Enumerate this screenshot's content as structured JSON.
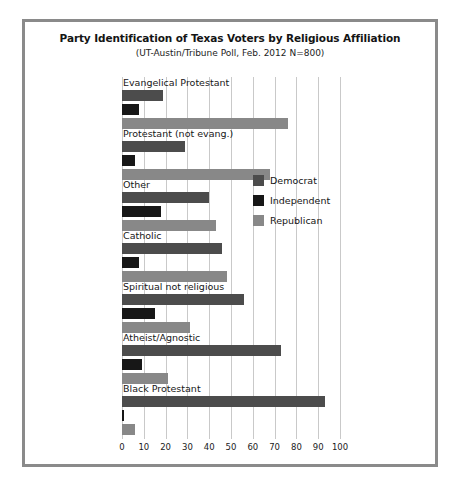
{
  "chart_data": {
    "type": "bar",
    "orientation": "horizontal",
    "title": "Party Identification of Texas Voters by Religious Affiliation",
    "subtitle": "(UT-Austin/Tribune Poll, Feb. 2012 N=800)",
    "xlabel": "",
    "ylabel": "",
    "xlim": [
      0,
      100
    ],
    "xticks": [
      0,
      10,
      20,
      30,
      40,
      50,
      60,
      70,
      80,
      90,
      100
    ],
    "xtick_labels": [
      "0",
      "10",
      "20",
      "30",
      "40",
      "50",
      "60",
      "70",
      "80",
      "90",
      "100"
    ],
    "grid": true,
    "legend_position": "middle-right",
    "categories": [
      "Evangelical Protestant",
      "Protestant (not evang.)",
      "Other",
      "Catholic",
      "Spiritual not religious",
      "Atheist/Agnostic",
      "Black Protestant"
    ],
    "series": [
      {
        "name": "Democrat",
        "color": "#4c4c4c",
        "values": [
          19,
          29,
          40,
          46,
          56,
          73,
          93
        ]
      },
      {
        "name": "Independent",
        "color": "#171717",
        "values": [
          8,
          6,
          18,
          8,
          15,
          9,
          1
        ]
      },
      {
        "name": "Republican",
        "color": "#888888",
        "values": [
          76,
          68,
          43,
          48,
          31,
          21,
          6
        ]
      }
    ]
  },
  "legend": {
    "items": [
      {
        "label": "Democrat",
        "color": "#4c4c4c"
      },
      {
        "label": "Independent",
        "color": "#171717"
      },
      {
        "label": "Republican",
        "color": "#888888"
      }
    ]
  },
  "frame": {
    "border_color": "#8a8a8a"
  }
}
